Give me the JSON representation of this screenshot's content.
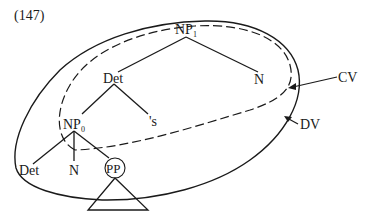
{
  "figure": {
    "number": "(147)",
    "nodes": {
      "np1": {
        "base": "NP",
        "sub": "1"
      },
      "det_top": "Det",
      "n_top": "N",
      "np0": {
        "base": "NP",
        "sub": "0"
      },
      "poss": "'s",
      "det_bottom": "Det",
      "n_bottom": "N",
      "pp": "PP"
    },
    "regions": {
      "cv": {
        "label": "CV",
        "style": "dashed"
      },
      "dv": {
        "label": "DV",
        "style": "solid"
      }
    },
    "edges": [
      [
        "NP1",
        "Det"
      ],
      [
        "NP1",
        "N"
      ],
      [
        "Det",
        "NP0"
      ],
      [
        "Det",
        "'s"
      ],
      [
        "NP0",
        "Det"
      ],
      [
        "NP0",
        "N"
      ],
      [
        "NP0",
        "PP"
      ],
      [
        "PP",
        "triangle"
      ]
    ]
  }
}
